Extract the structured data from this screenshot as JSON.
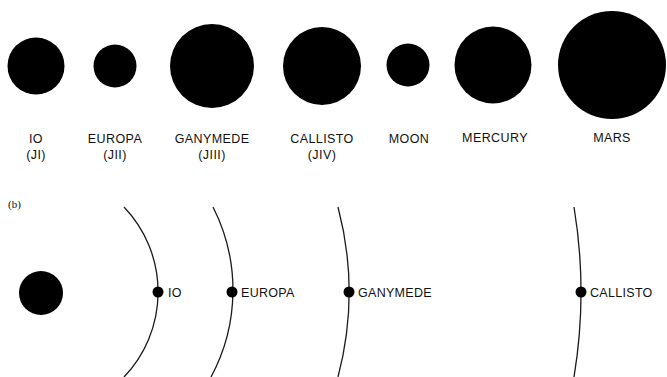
{
  "panel_a": {
    "bodies": [
      {
        "name": "IO",
        "designation": "(JI)",
        "cx": 36,
        "cy": 66,
        "r": 28.5
      },
      {
        "name": "EUROPA",
        "designation": "(JII)",
        "cx": 115,
        "cy": 66,
        "r": 21.5
      },
      {
        "name": "GANYMEDE",
        "designation": "(JIII)",
        "cx": 212,
        "cy": 66,
        "r": 42
      },
      {
        "name": "CALLISTO",
        "designation": "(JIV)",
        "cx": 322,
        "cy": 66,
        "r": 39
      },
      {
        "name": "MOON",
        "designation": "",
        "cx": 408,
        "cy": 65,
        "r": 21.5
      },
      {
        "name": "MERCURY",
        "designation": "",
        "cx": 493,
        "cy": 65,
        "r": 38.5
      },
      {
        "name": "MARS",
        "designation": "",
        "cx": 612,
        "cy": 65,
        "r": 54
      }
    ]
  },
  "panel_b": {
    "tag": "(b)",
    "central_body": {
      "cx": 41,
      "cy": 292,
      "r": 22
    },
    "orbits": [
      {
        "label": "IO",
        "peak_x": 158,
        "radius": 123
      },
      {
        "label": "EUROPA",
        "peak_x": 232,
        "radius": 183
      },
      {
        "label": "GANYMEDE",
        "peak_x": 349,
        "radius": 334
      },
      {
        "label": "CALLISTO",
        "peak_x": 581,
        "radius": 520
      }
    ]
  },
  "colors": {
    "fill": "#000000",
    "background": "#ffffff",
    "line": "#1a1a1a"
  }
}
